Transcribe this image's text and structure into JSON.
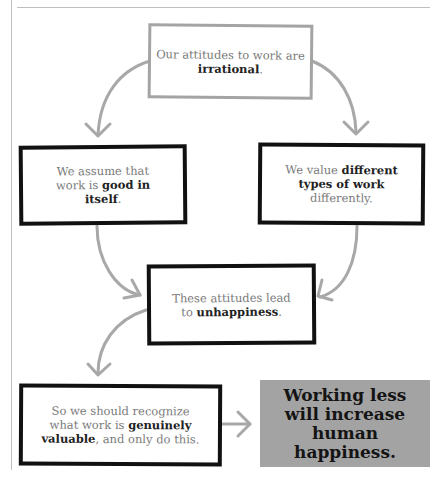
{
  "diagram": {
    "type": "argument-flowchart",
    "nodes": [
      {
        "id": "premise",
        "pre": "Our attitudes to work are ",
        "bold": "irrational",
        "post": ".",
        "style": "gray-outline"
      },
      {
        "id": "reason-left",
        "pre": "We assume that work is ",
        "bold": "good in itself",
        "post": ".",
        "style": "black-outline"
      },
      {
        "id": "reason-right",
        "pre": "We value ",
        "bold": "different types of work",
        "post": " differently.",
        "style": "black-outline"
      },
      {
        "id": "consequence",
        "pre": "These attitudes lead to ",
        "bold": "unhappiness",
        "post": ".",
        "style": "black-outline"
      },
      {
        "id": "recommendation",
        "pre": "So we should recognize what work is ",
        "bold": "genuinely valuable",
        "post": ", and only do this.",
        "style": "black-outline"
      },
      {
        "id": "conclusion",
        "text": "Working less will increase human happiness.",
        "style": "gray-filled"
      }
    ],
    "edges": [
      {
        "from": "premise",
        "to": "reason-left"
      },
      {
        "from": "premise",
        "to": "reason-right"
      },
      {
        "from": "reason-left",
        "to": "consequence"
      },
      {
        "from": "reason-right",
        "to": "consequence"
      },
      {
        "from": "consequence",
        "to": "recommendation"
      },
      {
        "from": "recommendation",
        "to": "conclusion"
      }
    ],
    "colors": {
      "arrow": "#a8a8a8",
      "conclusion_fill": "#a3a3a3",
      "outline_dark": "#111111",
      "outline_gray": "#a4a4a4"
    }
  }
}
